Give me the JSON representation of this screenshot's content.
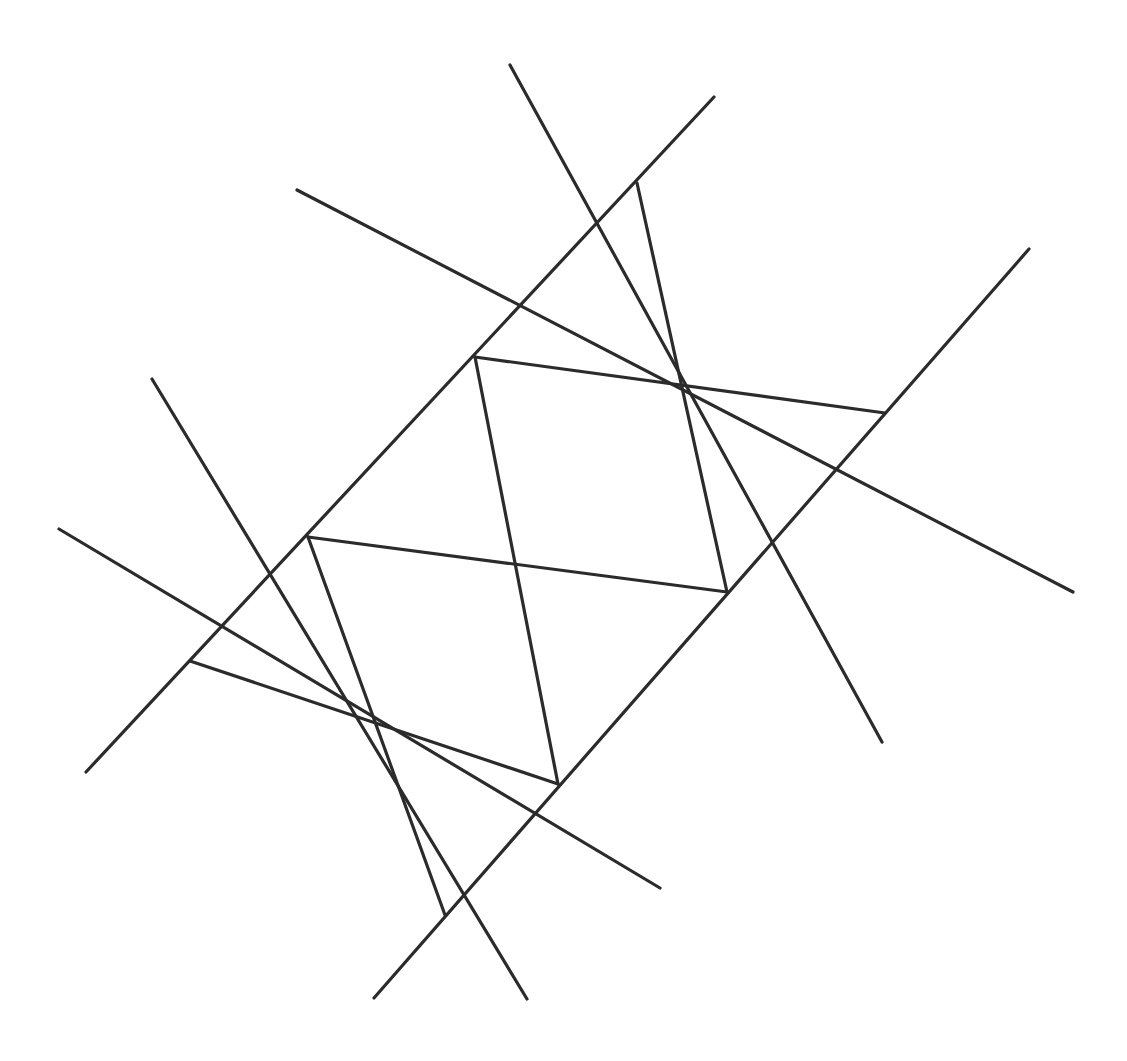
{
  "figure": {
    "canvas": {
      "width": 1127,
      "height": 1061
    },
    "background_color": "#ffffff",
    "stroke_color": "#2b2b2b",
    "stroke_width": 3.2,
    "line_count": 12,
    "node_count": 8
  },
  "chart_data": {
    "type": "diagram",
    "xlabel": "",
    "ylabel": "",
    "xlim": [
      0,
      1127
    ],
    "ylim": [
      0,
      1061
    ],
    "grid": false,
    "legend": "none",
    "nodes": [
      {
        "id": "n1",
        "label": "top-hub",
        "x": 637,
        "y": 183,
        "degree": 6
      },
      {
        "id": "n2",
        "label": "upper-left-hub",
        "x": 475,
        "y": 357,
        "degree": 6
      },
      {
        "id": "n3",
        "label": "right-hub",
        "x": 885,
        "y": 413,
        "degree": 6
      },
      {
        "id": "n4",
        "label": "left-hub",
        "x": 308,
        "y": 537,
        "degree": 6
      },
      {
        "id": "n5",
        "label": "lower-right-hub",
        "x": 727,
        "y": 592,
        "degree": 6
      },
      {
        "id": "n6",
        "label": "outer-left-cross",
        "x": 190,
        "y": 661,
        "degree": 5
      },
      {
        "id": "n7",
        "label": "bottom-hub",
        "x": 558,
        "y": 784,
        "degree": 6
      },
      {
        "id": "n8",
        "label": "outer-bottom-cross",
        "x": 445,
        "y": 915,
        "degree": 5
      }
    ],
    "lines": [
      {
        "id": "L1",
        "name": "upper-descender-left",
        "x1": 510,
        "y1": 65,
        "x2": 882,
        "y2": 742
      },
      {
        "id": "L2",
        "name": "top-right-diagonal",
        "x1": 714,
        "y1": 97,
        "x2": 86,
        "y2": 772
      },
      {
        "id": "L3",
        "name": "upper-left-long-diagonal",
        "x1": 297,
        "y1": 190,
        "x2": 1073,
        "y2": 592
      },
      {
        "id": "L4",
        "name": "right-upper-diagonal",
        "x1": 1029,
        "y1": 249,
        "x2": 374,
        "y2": 998
      },
      {
        "id": "L5",
        "name": "left-upper-diagonal",
        "x1": 152,
        "y1": 379,
        "x2": 527,
        "y2": 999
      },
      {
        "id": "L6",
        "name": "mid-left-diagonal",
        "x1": 59,
        "y1": 529,
        "x2": 660,
        "y2": 888
      },
      {
        "id": "L7",
        "name": "upper-chord",
        "x1": 475,
        "y1": 357,
        "x2": 885,
        "y2": 413
      },
      {
        "id": "L8",
        "name": "lower-chord",
        "x1": 308,
        "y1": 537,
        "x2": 727,
        "y2": 592
      },
      {
        "id": "L9",
        "name": "top-to-lower-right",
        "x1": 637,
        "y1": 183,
        "x2": 727,
        "y2": 592
      },
      {
        "id": "L10",
        "name": "upper-left-to-bottom",
        "x1": 475,
        "y1": 357,
        "x2": 558,
        "y2": 784
      },
      {
        "id": "L11",
        "name": "left-hub-to-bottom",
        "x1": 308,
        "y1": 537,
        "x2": 445,
        "y2": 915
      },
      {
        "id": "L12",
        "name": "outer-left-to-bottom-hub",
        "x1": 190,
        "y1": 661,
        "x2": 558,
        "y2": 784
      }
    ]
  }
}
